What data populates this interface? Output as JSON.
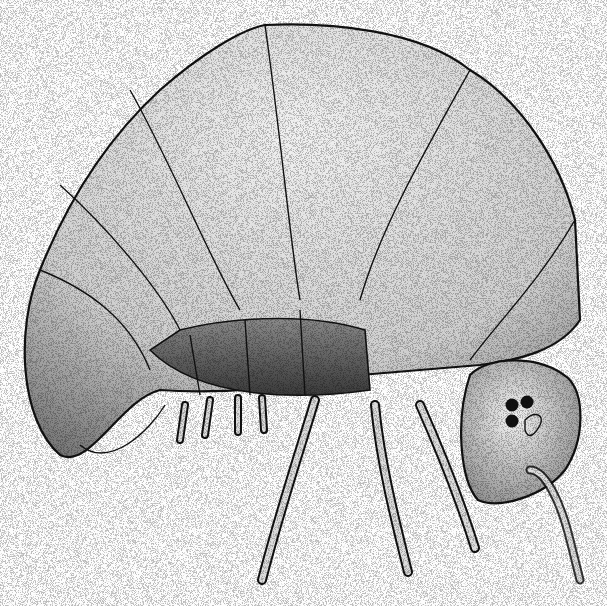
{
  "illustration": {
    "subject": "springtail (globular collembolan), lateral view",
    "style": "black-and-white stipple drawing",
    "background_color": "#fdfdfd",
    "ink_color": "#111111",
    "parts": [
      "body-segments",
      "head",
      "eyes",
      "antenna",
      "legs"
    ],
    "eye_count": 3
  }
}
